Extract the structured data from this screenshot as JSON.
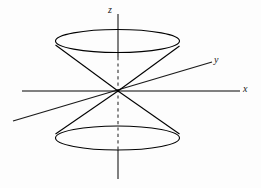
{
  "figure": {
    "name": "double-cone-3d-axes",
    "background_color": "#fdfdfd",
    "width": 261,
    "height": 188
  },
  "labels": {
    "z": "z",
    "y": "y",
    "x": "x"
  },
  "colors": {
    "axis_gray": "#808080",
    "axis_dark": "#1a1a1a",
    "cone_stroke": "#000000",
    "dashed_axis": "#707070",
    "label_color": "#1a1a1a"
  },
  "geometry": {
    "origin": {
      "x": 118,
      "y": 91
    },
    "z_axis": {
      "top": {
        "x": 118,
        "y": 14
      },
      "bottom": {
        "x": 118,
        "y": 179
      },
      "solid_upper_end_y": 57,
      "dashed_start_y": 57,
      "dashed_end_y": 150,
      "stroke_width": 2
    },
    "x_axis": {
      "start": {
        "x": 22,
        "y": 91
      },
      "end": {
        "x": 240,
        "y": 91
      },
      "stroke_width": 2
    },
    "y_axis": {
      "start": {
        "x": 13,
        "y": 121
      },
      "end": {
        "x": 212,
        "y": 62
      },
      "stroke_width": 1.3
    },
    "upper_ellipse": {
      "cx": 117.5,
      "cy": 41,
      "rx": 62,
      "ry": 11.5
    },
    "lower_ellipse": {
      "cx": 117.5,
      "cy": 138,
      "rx": 62,
      "ry": 12
    },
    "upper_cone_slants": [
      {
        "from": {
          "x": 55.5,
          "y": 45
        },
        "to": {
          "x": 118,
          "y": 91
        }
      },
      {
        "from": {
          "x": 179.5,
          "y": 46
        },
        "to": {
          "x": 118,
          "y": 91
        }
      }
    ],
    "lower_cone_slants": [
      {
        "from": {
          "x": 55.5,
          "y": 134
        },
        "to": {
          "x": 118,
          "y": 91
        }
      },
      {
        "from": {
          "x": 179.5,
          "y": 134
        },
        "to": {
          "x": 118,
          "y": 91
        }
      }
    ]
  }
}
